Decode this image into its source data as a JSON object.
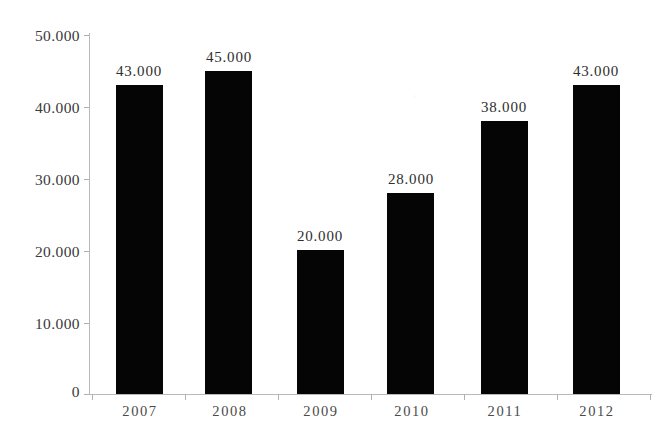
{
  "chart_data": {
    "type": "bar",
    "title": "",
    "subtitle": "",
    "xlabel": "",
    "ylabel": "",
    "categories": [
      "2007",
      "2008",
      "2009",
      "2010",
      "2011",
      "2012"
    ],
    "values": [
      43000,
      45000,
      20000,
      28000,
      38000,
      43000
    ],
    "value_labels": [
      "43.000",
      "45.000",
      "20.000",
      "28.000",
      "38.000",
      "43.000"
    ],
    "ylim": [
      0,
      50000
    ],
    "ytick_values": [
      50000,
      40000,
      30000,
      20000,
      10000,
      0
    ],
    "ytick_labels": [
      "50.000",
      "40.000",
      "30.000",
      "20.000",
      "10.000",
      "0"
    ],
    "grid": false,
    "legend": null,
    "series": [
      {
        "name": "",
        "values": [
          43000,
          45000,
          20000,
          28000,
          38000,
          43000
        ],
        "color": "#050505"
      }
    ],
    "annotations": []
  },
  "style": {
    "bar_color": "#050505",
    "axis_color": "#b9b9b9",
    "label_color": "#2e2e2e",
    "background": "#ffffff"
  }
}
